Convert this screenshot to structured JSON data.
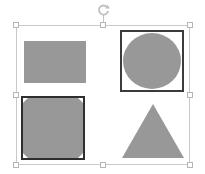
{
  "canvas": {
    "width": 205,
    "height": 174,
    "background_color": "#ffffff",
    "label": "shape-selection-canvas"
  },
  "selection": {
    "label": "Selected object group",
    "frame": {
      "left": 16,
      "top": 25,
      "width": 174,
      "height": 140,
      "border_color": "#c9c9c9"
    },
    "rotate_handle": {
      "icon": "rotate-icon",
      "tooltip": "Rotate",
      "color": "#bdbdbd"
    },
    "handle_fill": "#ffffff",
    "handle_border": "#b5b5b5",
    "handles": [
      {
        "name": "handle-top-left",
        "position": "top-left",
        "left": 13,
        "top": 22
      },
      {
        "name": "handle-top-center",
        "position": "top-center",
        "left": 100,
        "top": 22
      },
      {
        "name": "handle-top-right",
        "position": "top-right",
        "left": 187,
        "top": 22
      },
      {
        "name": "handle-middle-left",
        "position": "middle-left",
        "left": 13,
        "top": 92
      },
      {
        "name": "handle-middle-right",
        "position": "middle-right",
        "left": 187,
        "top": 92
      },
      {
        "name": "handle-bottom-left",
        "position": "bottom-left",
        "left": 13,
        "top": 162
      },
      {
        "name": "handle-bottom-center",
        "position": "bottom-center",
        "left": 100,
        "top": 162
      },
      {
        "name": "handle-bottom-right",
        "position": "bottom-right",
        "left": 187,
        "top": 162
      }
    ]
  },
  "shapes": [
    {
      "name": "shape-rectangle",
      "kind": "rectangle",
      "fill_color": "#989898",
      "stroke_color": "none",
      "stroke_width": 0,
      "left": 24,
      "top": 41,
      "width": 62,
      "height": 42
    },
    {
      "name": "shape-circle-in-frame",
      "kind": "circle-in-square",
      "fill_color": "#989898",
      "stroke_color": "#3b3b3b",
      "stroke_width": 2,
      "left": 120,
      "top": 30,
      "width": 64,
      "height": 62
    },
    {
      "name": "shape-clipped-circle-in-frame",
      "kind": "clipped-circle-in-square",
      "fill_color": "#989898",
      "stroke_color": "#2e2e2e",
      "stroke_width": 2,
      "left": 21,
      "top": 96,
      "width": 64,
      "height": 64
    },
    {
      "name": "shape-triangle",
      "kind": "triangle",
      "fill_color": "#989898",
      "stroke_color": "none",
      "stroke_width": 0,
      "left": 122,
      "top": 104,
      "width": 62,
      "height": 54
    }
  ]
}
